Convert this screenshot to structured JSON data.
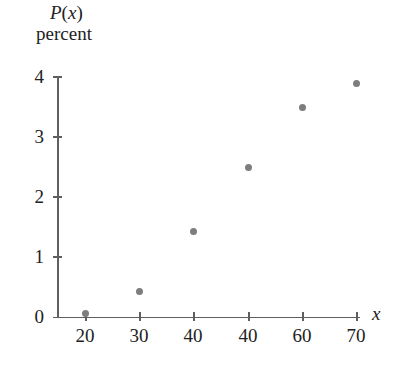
{
  "chart_data": {
    "type": "scatter",
    "title": "",
    "ylabel": "P(x) percent",
    "ylabel_parts": {
      "function_letter": "P",
      "function_arg": "x",
      "unit": "percent"
    },
    "xlabel": "x",
    "x": [
      20,
      30,
      40,
      40,
      60,
      70
    ],
    "values": [
      0.05,
      0.42,
      1.42,
      2.47,
      3.47,
      3.87
    ],
    "points": [
      {
        "x": 20,
        "y": 0.05
      },
      {
        "x": 30,
        "y": 0.42
      },
      {
        "x": 40,
        "y": 1.42
      },
      {
        "x": 40,
        "y": 2.47
      },
      {
        "x": 60,
        "y": 3.47
      },
      {
        "x": 70,
        "y": 3.87
      }
    ],
    "xticks": [
      "20",
      "30",
      "40",
      "40",
      "60",
      "70"
    ],
    "yticks": [
      "0",
      "1",
      "2",
      "3",
      "4"
    ],
    "xlim": [
      15,
      75
    ],
    "ylim": [
      0,
      4
    ],
    "grid": false,
    "legend": false,
    "marker_color": "#7d7d7d",
    "axis_color": "#5f5f5f",
    "background": "#ffffff"
  }
}
